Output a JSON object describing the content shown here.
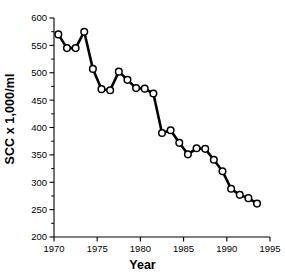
{
  "chart_data": {
    "type": "line",
    "title": "",
    "xlabel": "Year",
    "ylabel": "SCC x 1,000/ml",
    "xlim": [
      1970,
      1995
    ],
    "ylim": [
      200,
      600
    ],
    "xticks": [
      1970,
      1975,
      1980,
      1985,
      1990,
      1995
    ],
    "xticklabels": [
      "1970",
      "1975",
      "1980",
      "1985",
      "1990",
      "1995"
    ],
    "yticks": [
      200,
      250,
      300,
      350,
      400,
      450,
      500,
      550,
      600
    ],
    "yticklabels": [
      "200",
      "250",
      "300",
      "350",
      "400",
      "450",
      "500",
      "550",
      "600"
    ],
    "minor_ytick_step": 25,
    "grid": false,
    "legend": null,
    "marker": "open-circle",
    "line_color": "#000000",
    "marker_face_color": "#ffffff",
    "marker_edge_color": "#000000",
    "x": [
      1970.5,
      1971.5,
      1972.5,
      1973.5,
      1974.5,
      1975.5,
      1976.5,
      1977.5,
      1978.5,
      1979.5,
      1980.5,
      1981.5,
      1982.5,
      1983.5,
      1984.5,
      1985.5,
      1986.5,
      1987.5,
      1988.5,
      1989.5,
      1990.5,
      1991.5,
      1992.5,
      1993.5
    ],
    "values": [
      570,
      545,
      545,
      575,
      507,
      470,
      468,
      502,
      487,
      472,
      471,
      462,
      390,
      395,
      372,
      351,
      362,
      361,
      341,
      320,
      288,
      277,
      271,
      261
    ],
    "series": [
      {
        "name": "SCC",
        "values": [
          570,
          545,
          545,
          575,
          507,
          470,
          468,
          502,
          487,
          472,
          471,
          462,
          390,
          395,
          372,
          351,
          362,
          361,
          341,
          320,
          288,
          277,
          271,
          261
        ]
      }
    ]
  }
}
